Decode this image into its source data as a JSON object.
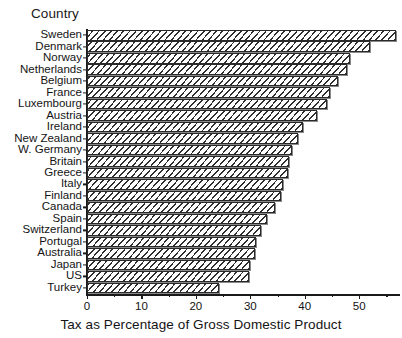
{
  "chart_data": {
    "type": "bar",
    "orientation": "horizontal",
    "title": "",
    "ylabel": "Country",
    "xlabel": "Tax as Percentage of Gross Domestic Product",
    "xlim": [
      0,
      57.5
    ],
    "grid": false,
    "legend": null,
    "xticks": [
      0,
      10,
      20,
      30,
      40,
      50
    ],
    "xtick_labels": [
      "0",
      "10",
      "20",
      "30",
      "40",
      "50"
    ],
    "minor_xticks": [
      5,
      15,
      25,
      35,
      45,
      55
    ],
    "categories": [
      "Sweden",
      "Denmark",
      "Norway",
      "Netherlands",
      "Belgium",
      "France",
      "Luxembourg",
      "Austria",
      "Ireland",
      "New Zealand",
      "W. Germany",
      "Britain",
      "Greece",
      "Italy",
      "Finland",
      "Canada",
      "Spain",
      "Switzerland",
      "Portugal",
      "Australia",
      "Japan",
      "US",
      "Turkey"
    ],
    "values": [
      56.8,
      51.9,
      48.3,
      47.8,
      46.2,
      44.7,
      44.0,
      42.2,
      39.7,
      38.8,
      37.7,
      37.2,
      36.9,
      36.0,
      35.6,
      34.6,
      33.1,
      32.0,
      31.0,
      30.9,
      30.0,
      29.8,
      24.3
    ],
    "bar_fill": "#ffffff",
    "bar_edge": "#2a2a2a",
    "hatch": "///"
  }
}
